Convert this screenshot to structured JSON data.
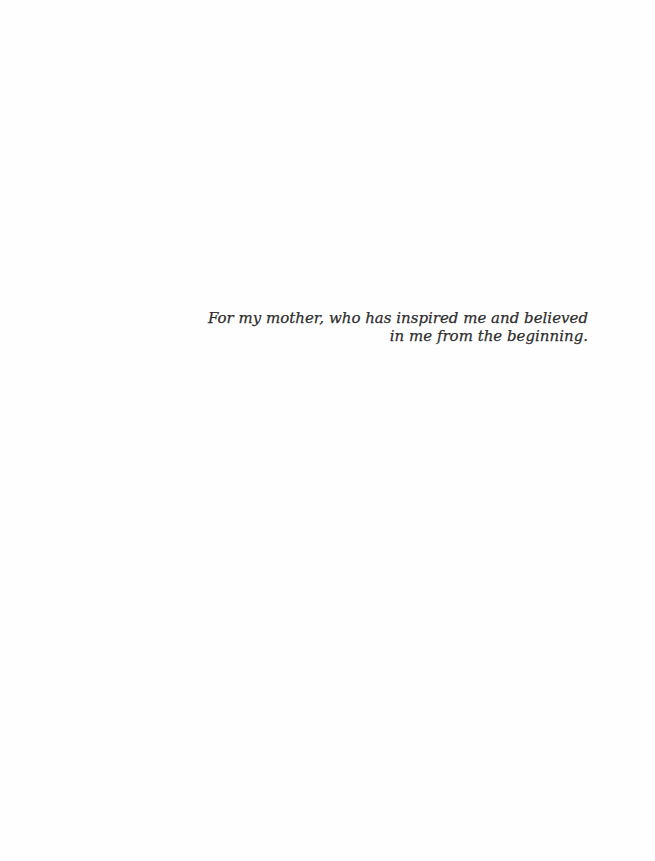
{
  "page": {
    "type": "dedication",
    "background_color": "#fefefe",
    "text_color": "#2e2e2e"
  },
  "dedication": {
    "lines": [
      "For my mother, who has inspired me and believed",
      "in me from the beginning."
    ]
  }
}
